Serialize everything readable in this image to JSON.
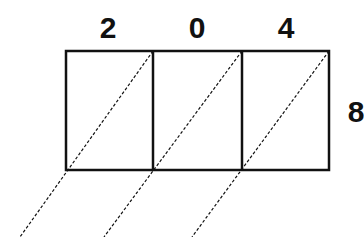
{
  "diagram": {
    "type": "lattice-multiplication",
    "top_digits": [
      "2",
      "0",
      "4"
    ],
    "side_digit": "8",
    "colors": {
      "stroke": "#111111",
      "background": "#ffffff"
    }
  }
}
